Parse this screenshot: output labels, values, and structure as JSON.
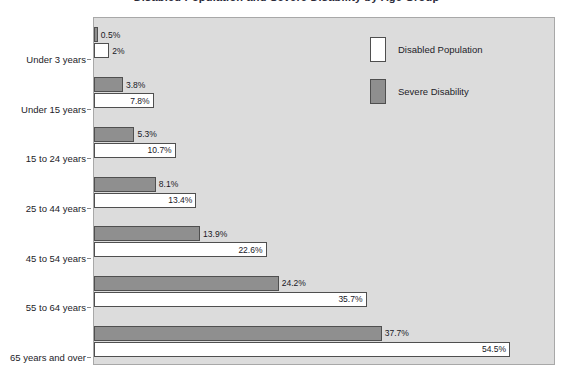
{
  "chart_data": {
    "type": "bar",
    "orientation": "horizontal",
    "title": "Disabled Population and Severe Disability by Age Group",
    "xlabel": "",
    "ylabel": "",
    "grid": false,
    "xlim": [
      0,
      60
    ],
    "legend_position": "top-right",
    "categories": [
      "Under 3 years",
      "Under 15 years",
      "15 to 24 years",
      "25 to 44 years",
      "45 to 54 years",
      "55 to 64 years",
      "65 years and over"
    ],
    "series": [
      {
        "name": "Severe Disability",
        "color": "#8f8f8f",
        "values": [
          0.5,
          3.8,
          5.3,
          8.1,
          13.9,
          24.2,
          37.7
        ],
        "labels": [
          "0.5%",
          "3.8%",
          "5.3%",
          "8.1%",
          "13.9%",
          "24.2%",
          "37.7%"
        ]
      },
      {
        "name": "Disabled Population",
        "color": "#ffffff",
        "values": [
          2.0,
          7.8,
          10.7,
          13.4,
          22.6,
          35.7,
          54.5
        ],
        "labels": [
          "2%",
          "7.8%",
          "10.7%",
          "13.4%",
          "22.6%",
          "35.7%",
          "54.5%"
        ]
      }
    ]
  },
  "legend": {
    "items": [
      {
        "label": "Disabled Population",
        "swatch": "disabled"
      },
      {
        "label": "Severe Disability",
        "swatch": "severe"
      }
    ]
  },
  "colors": {
    "plot_background": "#dcdcdc",
    "page_background": "#ffffff",
    "severe_bar": "#8f8f8f",
    "disabled_bar": "#ffffff",
    "bar_outline": "#4f4f4f",
    "text": "#1c1c28"
  }
}
